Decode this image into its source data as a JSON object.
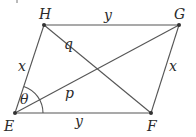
{
  "diagram": {
    "type": "parallelogram",
    "title": "",
    "vertices": {
      "E": {
        "label": "E",
        "x": 15,
        "y": 113
      },
      "F": {
        "label": "F",
        "x": 151,
        "y": 113
      },
      "G": {
        "label": "G",
        "x": 179,
        "y": 25
      },
      "H": {
        "label": "H",
        "x": 44,
        "y": 25
      }
    },
    "sides": {
      "HG": {
        "label": "y"
      },
      "EF": {
        "label": "y"
      },
      "EH": {
        "label": "x"
      },
      "FG": {
        "label": "x"
      }
    },
    "diagonals": {
      "EG": {
        "label": "p"
      },
      "HF": {
        "label": "q"
      }
    },
    "angle": {
      "vertex": "E",
      "between": [
        "EH",
        "EG"
      ],
      "label": "θ"
    },
    "colors": {
      "line": "#555555",
      "point": "#333333",
      "text": "#2a2a2a",
      "background": "#ffffff"
    }
  }
}
